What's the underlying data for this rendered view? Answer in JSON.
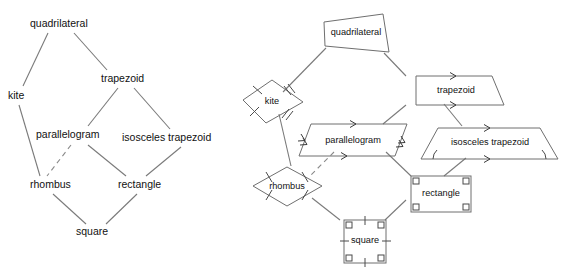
{
  "figure": {
    "background_color": "#ffffff",
    "line_color": "#7a7a7a",
    "shape_stroke_color": "#6f6f6f",
    "text_color": "#111111"
  },
  "left_diagram": {
    "name": "quadrilateral-hierarchy-text-tree",
    "nodes": [
      {
        "id": "quadrilateral",
        "label": "quadrilateral",
        "x": 30,
        "y": 24,
        "anchor": "start"
      },
      {
        "id": "kite",
        "label": "kite",
        "x": 8,
        "y": 96,
        "anchor": "start"
      },
      {
        "id": "trapezoid",
        "label": "trapezoid",
        "x": 101,
        "y": 79,
        "anchor": "start"
      },
      {
        "id": "parallelogram",
        "label": "parallelogram",
        "x": 36,
        "y": 135,
        "anchor": "start"
      },
      {
        "id": "isosceles_trapezoid",
        "label": "isosceles trapezoid",
        "x": 122,
        "y": 138,
        "anchor": "start"
      },
      {
        "id": "rhombus",
        "label": "rhombus",
        "x": 30,
        "y": 185,
        "anchor": "start"
      },
      {
        "id": "rectangle",
        "label": "rectangle",
        "x": 118,
        "y": 185,
        "anchor": "start"
      },
      {
        "id": "square",
        "label": "square",
        "x": 76,
        "y": 232,
        "anchor": "start"
      }
    ],
    "edges": [
      {
        "from": "quadrilateral",
        "to": "kite",
        "style": "solid"
      },
      {
        "from": "quadrilateral",
        "to": "trapezoid",
        "style": "solid"
      },
      {
        "from": "kite",
        "to": "rhombus",
        "style": "solid"
      },
      {
        "from": "trapezoid",
        "to": "parallelogram",
        "style": "solid"
      },
      {
        "from": "trapezoid",
        "to": "isosceles_trapezoid",
        "style": "solid"
      },
      {
        "from": "parallelogram",
        "to": "rhombus",
        "style": "dashed"
      },
      {
        "from": "parallelogram",
        "to": "rectangle",
        "style": "solid"
      },
      {
        "from": "isosceles_trapezoid",
        "to": "rectangle",
        "style": "solid"
      },
      {
        "from": "rhombus",
        "to": "square",
        "style": "solid"
      },
      {
        "from": "rectangle",
        "to": "square",
        "style": "solid"
      }
    ]
  },
  "right_diagram": {
    "name": "quadrilateral-hierarchy-shape-tree",
    "nodes": [
      {
        "id": "quadrilateral",
        "label": "quadrilateral",
        "shape": "irregular-quadrilateral",
        "marks": "none"
      },
      {
        "id": "kite",
        "label": "kite",
        "shape": "kite",
        "marks": "single-and-double-tick-marks"
      },
      {
        "id": "trapezoid",
        "label": "trapezoid",
        "shape": "right-trapezoid",
        "marks": "single-arrow-parallel-sides"
      },
      {
        "id": "parallelogram",
        "label": "parallelogram",
        "shape": "parallelogram",
        "marks": "single-and-double-arrow-parallel-sides"
      },
      {
        "id": "isosceles_trapezoid",
        "label": "isosceles trapezoid",
        "shape": "isosceles-trapezoid",
        "marks": "single-arrow-parallel-sides-and-base-angle-arcs"
      },
      {
        "id": "rhombus",
        "label": "rhombus",
        "shape": "rhombus",
        "marks": "single-tick-all-sides"
      },
      {
        "id": "rectangle",
        "label": "rectangle",
        "shape": "rectangle",
        "marks": "right-angle-corner-squares"
      },
      {
        "id": "square",
        "label": "square",
        "shape": "square",
        "marks": "right-angle-corner-squares-and-single-tick-all-sides"
      }
    ],
    "edges": [
      {
        "from": "quadrilateral",
        "to": "kite",
        "style": "solid"
      },
      {
        "from": "quadrilateral",
        "to": "trapezoid",
        "style": "solid"
      },
      {
        "from": "kite",
        "to": "rhombus",
        "style": "solid"
      },
      {
        "from": "trapezoid",
        "to": "parallelogram",
        "style": "solid"
      },
      {
        "from": "trapezoid",
        "to": "isosceles_trapezoid",
        "style": "solid"
      },
      {
        "from": "parallelogram",
        "to": "rhombus",
        "style": "dashed"
      },
      {
        "from": "parallelogram",
        "to": "rectangle",
        "style": "solid"
      },
      {
        "from": "isosceles_trapezoid",
        "to": "rectangle",
        "style": "solid"
      },
      {
        "from": "rhombus",
        "to": "square",
        "style": "solid"
      },
      {
        "from": "rectangle",
        "to": "square",
        "style": "solid"
      }
    ]
  }
}
